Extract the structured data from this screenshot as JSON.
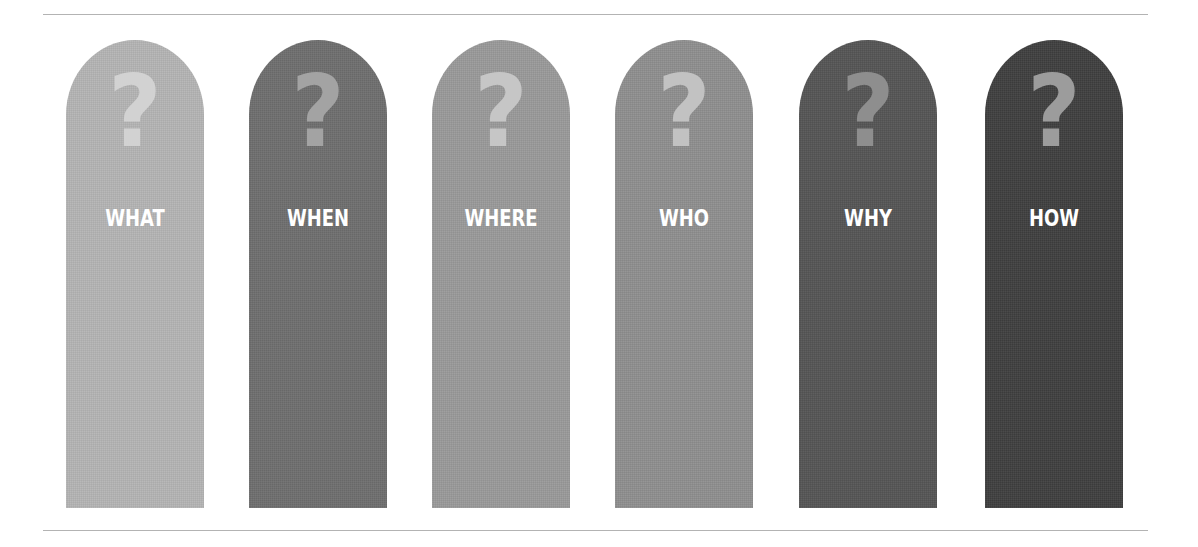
{
  "rules": {
    "color": "#b3b3b3"
  },
  "pillars": [
    {
      "label": "WHAT",
      "icon": "question-mark",
      "glyph": "?",
      "color": "#b5b5b5",
      "icon_color": "#d2d2d2",
      "left": 66
    },
    {
      "label": "WHEN",
      "icon": "question-mark",
      "glyph": "?",
      "color": "#6e6e6e",
      "icon_color": "#a3a3a3",
      "left": 249
    },
    {
      "label": "WHERE",
      "icon": "question-mark",
      "glyph": "?",
      "color": "#9a9a9a",
      "icon_color": "#c6c6c6",
      "left": 432
    },
    {
      "label": "WHO",
      "icon": "question-mark",
      "glyph": "?",
      "color": "#8f8f8f",
      "icon_color": "#c2c2c2",
      "left": 615
    },
    {
      "label": "WHY",
      "icon": "question-mark",
      "glyph": "?",
      "color": "#555555",
      "icon_color": "#8e8e8e",
      "left": 799
    },
    {
      "label": "HOW",
      "icon": "question-mark",
      "glyph": "?",
      "color": "#3f3f3f",
      "icon_color": "#9c9c9c",
      "left": 985
    }
  ]
}
